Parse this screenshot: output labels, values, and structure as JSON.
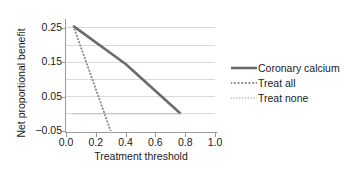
{
  "chart_data": {
    "type": "line",
    "title": "",
    "xlabel": "Treatment threshold",
    "ylabel": "Net proportional benefit",
    "xlim": [
      0.0,
      1.0
    ],
    "ylim": [
      -0.05,
      0.27
    ],
    "grid": true,
    "grid_axis": "y",
    "grid_values": [
      -0.05,
      0.0,
      0.05,
      0.1,
      0.15,
      0.2,
      0.25
    ],
    "xticks": [
      0.0,
      0.2,
      0.4,
      0.6,
      0.8,
      1.0
    ],
    "xtick_labels": [
      "0.0",
      "0.2",
      "0.4",
      "0.6",
      "0.8",
      "1.0"
    ],
    "yticks": [
      0.25,
      0.15,
      0.05,
      -0.05
    ],
    "ytick_labels": [
      "0.25",
      "0.15",
      "0.05",
      "−0.05"
    ],
    "legend_position": "right",
    "series": [
      {
        "name": "Coronary calcium",
        "style": "solid",
        "color": "#6b6b6b",
        "width": 2.6,
        "points": [
          [
            0.05,
            0.255
          ],
          [
            0.4,
            0.145
          ],
          [
            0.77,
            0.0
          ]
        ]
      },
      {
        "name": "Treat all",
        "style": "dotted",
        "color": "#8a8a8a",
        "width": 1.9,
        "points": [
          [
            0.05,
            0.255
          ],
          [
            0.3,
            -0.05
          ]
        ]
      },
      {
        "name": "Treat none",
        "style": "dotted",
        "color": "#b8b8b8",
        "width": 1.5,
        "points": [
          [
            0.05,
            0.0
          ],
          [
            0.77,
            0.0
          ]
        ]
      }
    ]
  },
  "legend": {
    "entries": [
      {
        "label": "Coronary calcium"
      },
      {
        "label": "Treat all"
      },
      {
        "label": "Treat none"
      }
    ]
  },
  "axes": {
    "x_title": "Treatment threshold",
    "y_title": "Net proportional benefit",
    "x_tick_labels": [
      "0.0",
      "0.2",
      "0.4",
      "0.6",
      "0.8",
      "1.0"
    ],
    "y_tick_labels": [
      "0.25",
      "0.15",
      "0.05",
      "−0.05"
    ]
  },
  "colors": {
    "grid": "#d9d9d9",
    "axis": "#9a9a9a",
    "text": "#1a1a1a",
    "series_solid": "#6b6b6b",
    "series_dotted_dark": "#8a8a8a",
    "series_dotted_light": "#b8b8b8",
    "background": "#ffffff"
  }
}
